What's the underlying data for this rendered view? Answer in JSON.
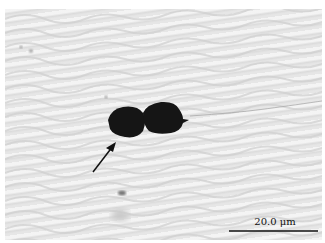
{
  "figure": {
    "type": "optical micrograph",
    "annotations": {
      "arrow": "points to dark particle pair",
      "scale_bar": {
        "label": "20.0 μm",
        "color": "#111111"
      }
    },
    "colors": {
      "background": "#e6e6e6",
      "particle": "#151515"
    }
  }
}
